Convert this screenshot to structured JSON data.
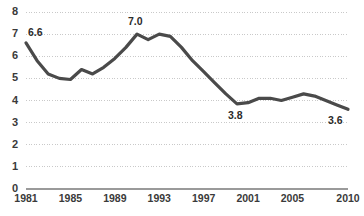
{
  "chart_data": {
    "type": "line",
    "title": "",
    "subtitle": "",
    "xlabel": "",
    "ylabel": "",
    "xlim": [
      1981,
      2010
    ],
    "ylim": [
      0,
      8
    ],
    "grid": true,
    "legend": "none",
    "y_ticks": [
      "8",
      "7",
      "6",
      "5",
      "4",
      "3",
      "2",
      "1",
      "0"
    ],
    "y_tick_values": [
      8,
      7,
      6,
      5,
      4,
      3,
      2,
      1,
      0
    ],
    "x_ticks": [
      "1981",
      "1985",
      "1989",
      "1993",
      "1997",
      "2001",
      "2005",
      "2010"
    ],
    "x_tick_values": [
      1981,
      1985,
      1989,
      1993,
      1997,
      2001,
      2005,
      2010
    ],
    "x": [
      1981,
      1982,
      1983,
      1984,
      1985,
      1986,
      1987,
      1988,
      1989,
      1990,
      1991,
      1992,
      1993,
      1994,
      1995,
      1996,
      1997,
      1998,
      1999,
      2000,
      2001,
      2002,
      2003,
      2004,
      2005,
      2006,
      2007,
      2008,
      2009,
      2010
    ],
    "values": [
      6.6,
      5.8,
      5.2,
      5.0,
      4.95,
      5.4,
      5.2,
      5.5,
      5.9,
      6.4,
      7.0,
      6.75,
      7.0,
      6.9,
      6.4,
      5.8,
      5.3,
      4.8,
      4.3,
      3.85,
      3.9,
      4.1,
      4.1,
      4.0,
      4.15,
      4.3,
      4.2,
      4.0,
      3.8,
      3.6
    ],
    "annotations": [
      {
        "label": "6.6",
        "x": 1981,
        "y": 6.6,
        "position": "above-right"
      },
      {
        "label": "7.0",
        "x": 1991,
        "y": 7.0,
        "position": "above"
      },
      {
        "label": "3.8",
        "x": 2000,
        "y": 3.85,
        "position": "below"
      },
      {
        "label": "3.6",
        "x": 2010,
        "y": 3.6,
        "position": "below-left"
      }
    ],
    "colors": {
      "line": "#4a4a4a",
      "grid": "#c9c9c9",
      "axis": "#9a9a9a",
      "tick_text": "#3a3a3a",
      "label_text": "#2b2b2b",
      "background": "#ffffff"
    },
    "line_width": 3.2
  }
}
